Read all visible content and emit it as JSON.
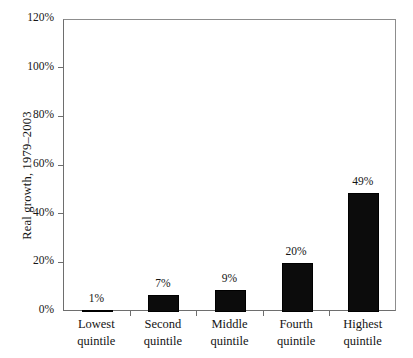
{
  "chart_data": {
    "type": "bar",
    "title": "",
    "xlabel": "",
    "ylabel": "Real growth, 1979–2003",
    "categories": [
      "Lowest quintile",
      "Second quintile",
      "Middle quintile",
      "Fourth quintile",
      "Highest quintile"
    ],
    "category_lines": [
      [
        "Lowest",
        "quintile"
      ],
      [
        "Second",
        "quintile"
      ],
      [
        "Middle",
        "quintile"
      ],
      [
        "Fourth",
        "quintile"
      ],
      [
        "Highest",
        "quintile"
      ]
    ],
    "values": [
      1,
      7,
      9,
      20,
      49
    ],
    "value_labels": [
      "1%",
      "7%",
      "9%",
      "20%",
      "49%"
    ],
    "ylim": [
      0,
      120
    ],
    "ytick_values": [
      0,
      20,
      40,
      60,
      80,
      100,
      120
    ],
    "ytick_labels": [
      "0%",
      "20%",
      "40%",
      "60%",
      "80%",
      "100%",
      "120%"
    ],
    "grid": false,
    "legend": false,
    "bar_color": "#0c0c0c",
    "axis_color": "#6e6e6e",
    "background_color": "#ffffff"
  },
  "axis": {
    "y_title": "Real growth, 1979–2003"
  }
}
